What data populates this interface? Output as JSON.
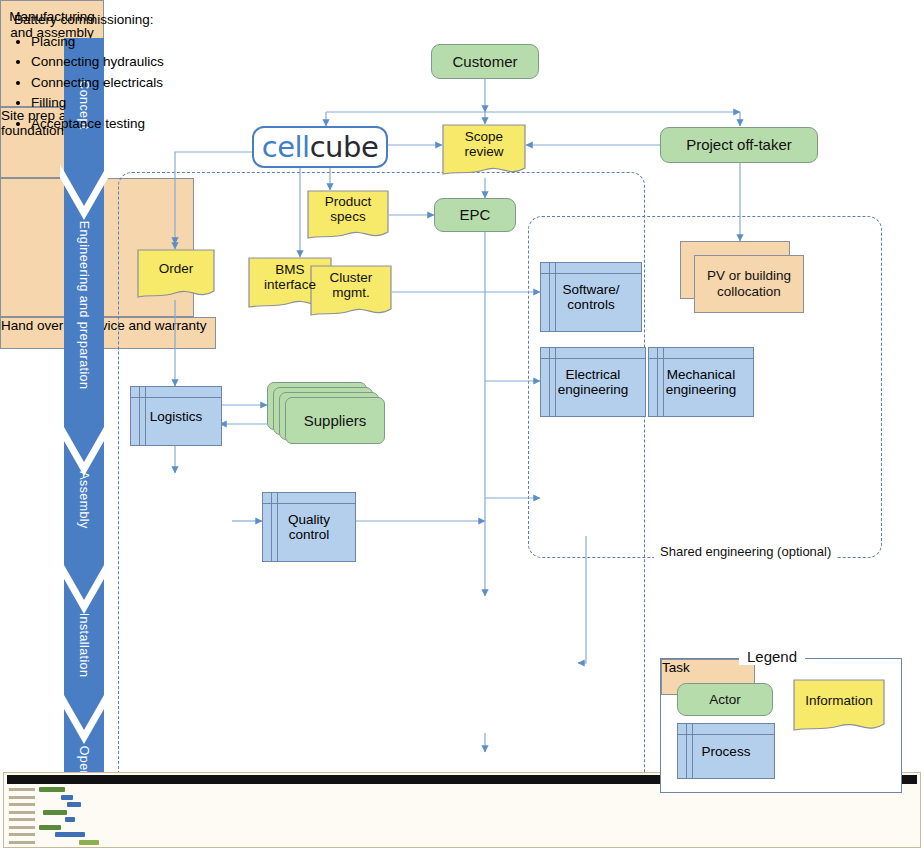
{
  "diagram": {
    "colors": {
      "actor_fill": "#b7dcab",
      "information_fill": "#f7e96a",
      "process_fill": "#b3cfec",
      "task_fill": "#f6d6ac",
      "connector": "#6d9ad0",
      "phase_arrow": "#4a7ec4",
      "logo_blue": "#3f7fc8",
      "logo_dark": "#2a2a33",
      "dashed_border": "#5b7fb5"
    }
  },
  "phases": [
    {
      "label": "Concept"
    },
    {
      "label": "Engineering and preparation"
    },
    {
      "label": "Assembly"
    },
    {
      "label": "Installation"
    },
    {
      "label": "Operation"
    }
  ],
  "logo": {
    "part1": "cell",
    "part2": "cube"
  },
  "nodes": {
    "customer": {
      "label": "Customer",
      "type": "actor"
    },
    "scope_review": {
      "label_line1": "Scope",
      "label_line2": "review",
      "type": "information"
    },
    "project_offtaker": {
      "label": "Project off-taker",
      "type": "actor"
    },
    "epc": {
      "label": "EPC",
      "type": "actor"
    },
    "product_specs": {
      "label_line1": "Product",
      "label_line2": "specs",
      "type": "information"
    },
    "bms_interface": {
      "label_line1": "BMS",
      "label_line2": "interface",
      "type": "information"
    },
    "cluster_mgmt": {
      "label_line1": "Cluster",
      "label_line2": "mgmt.",
      "type": "information"
    },
    "order": {
      "label": "Order",
      "type": "information"
    },
    "logistics": {
      "label": "Logistics",
      "type": "process"
    },
    "suppliers": {
      "label": "Suppliers",
      "type": "actor"
    },
    "manufacturing": {
      "label_line1": "Manufacturing",
      "label_line2": "and assembly",
      "type": "task"
    },
    "quality_control": {
      "label_line1": "Quality",
      "label_line2": "control",
      "type": "process"
    },
    "software_controls": {
      "label_line1": "Software/",
      "label_line2": "controls",
      "type": "process"
    },
    "pv_collocation": {
      "label_line1": "PV or building",
      "label_line2": "collocation",
      "type": "task"
    },
    "electrical_engineering": {
      "label_line1": "Electrical",
      "label_line2": "engineering",
      "type": "process"
    },
    "mechanical_engineering": {
      "label_line1": "Mechanical",
      "label_line2": "engineering",
      "type": "process"
    },
    "site_prep": {
      "label_line1": "Site prep and",
      "label_line2": "foundation",
      "type": "task"
    },
    "battery_commissioning": {
      "heading": "Battery commissioning:",
      "items": [
        "Placing",
        "Connecting hydraulics",
        "Connecting electricals",
        "Filling",
        "Acceptance testing"
      ],
      "type": "task"
    },
    "hand_over": {
      "label": "Hand over to service and warranty",
      "type": "task"
    }
  },
  "groups": {
    "cellcube": {
      "label": "CellCube"
    },
    "shared_engineering": {
      "label": "Shared engineering (optional)"
    }
  },
  "legend": {
    "title": "Legend",
    "items": [
      {
        "label": "Actor",
        "type": "actor"
      },
      {
        "label": "Information",
        "type": "information"
      },
      {
        "label": "Process",
        "type": "process"
      },
      {
        "label": "Task",
        "type": "task"
      }
    ]
  }
}
